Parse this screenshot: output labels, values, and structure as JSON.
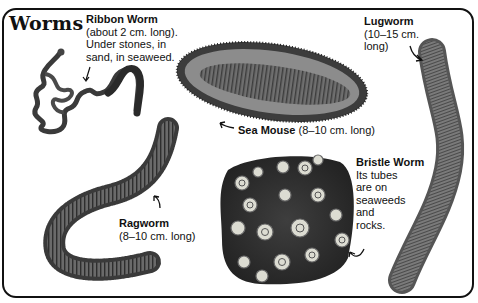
{
  "page": {
    "title": "Worms"
  },
  "species": {
    "ribbon_worm": {
      "name": "Ribbon Worm",
      "lines": [
        "(about 2 cm. long).",
        "Under stones, in",
        "sand, in seaweed."
      ]
    },
    "lugworm": {
      "name": "Lugworm",
      "lines": [
        "(10–15 cm.",
        "long)"
      ]
    },
    "sea_mouse": {
      "name": "Sea Mouse",
      "size": "(8–10 cm. long)"
    },
    "bristle_worm": {
      "name": "Bristle Worm",
      "lines": [
        "Its tubes",
        "are on",
        "seaweeds",
        "and",
        "rocks."
      ]
    },
    "ragworm": {
      "name": "Ragworm",
      "lines": [
        "(8–10 cm. long)"
      ]
    }
  },
  "colors": {
    "ink": "#111111",
    "worm_dark": "#3a3a3a",
    "worm_mid": "#6e6e6e",
    "worm_light": "#b8b8b8",
    "tube_light": "#e8e8e0"
  }
}
